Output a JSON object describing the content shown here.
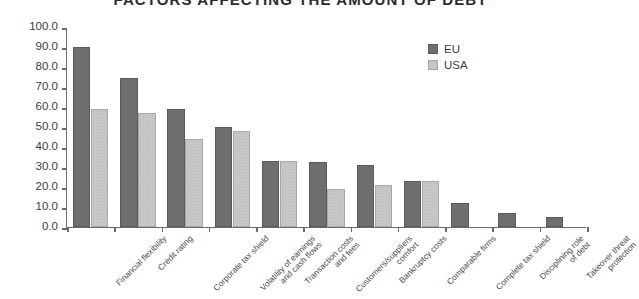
{
  "chart_data": {
    "type": "bar",
    "title": "FACTORS AFFECTING THE AMOUNT OF DEBT",
    "xlabel": "",
    "ylabel": "",
    "ylim": [
      0,
      100
    ],
    "ytick_labels": [
      "100.0",
      "90.0",
      "80.0",
      "70.0",
      "60.0",
      "50.0",
      "40.0",
      "30.0",
      "20.0",
      "10.0",
      "0.0"
    ],
    "ytick_values": [
      100,
      90,
      80,
      70,
      60,
      50,
      40,
      30,
      20,
      10,
      0
    ],
    "grid": false,
    "legend_position": "top-right",
    "categories": [
      "Financial flexibility",
      "Credit rating",
      "Corporate tax shield",
      "Volatility of earnings\nand cash flows",
      "Transaction costs\nand fees",
      "Customers/suppliers\ncomfort",
      "Bankruptcy costs",
      "Comparable firms",
      "Complete tax shield",
      "Disciplining role\nof debt",
      "Takeover threat\nprotection"
    ],
    "category_lines": [
      [
        "Financial flexibility"
      ],
      [
        "Credit rating"
      ],
      [
        "Corporate tax shield"
      ],
      [
        "Volatility of earnings",
        "and cash flows"
      ],
      [
        "Transaction costs",
        "and fees"
      ],
      [
        "Customers/suppliers",
        "comfort"
      ],
      [
        "Bankruptcy costs"
      ],
      [
        "Comparable firms"
      ],
      [
        "Complete tax shield"
      ],
      [
        "Disciplining role",
        "of debt"
      ],
      [
        "Takeover threat",
        "protection"
      ]
    ],
    "series": [
      {
        "name": "EU",
        "color": "#6e6e6e",
        "values": [
          90.0,
          74.5,
          59.0,
          50.0,
          33.0,
          32.5,
          31.0,
          23.0,
          12.0,
          7.0,
          5.0
        ]
      },
      {
        "name": "USA",
        "color": "#c7c7c7",
        "values": [
          59.0,
          57.0,
          44.0,
          48.0,
          33.0,
          19.0,
          21.0,
          23.0,
          null,
          null,
          null
        ]
      }
    ]
  },
  "legend": {
    "items": [
      {
        "label": "EU",
        "swatch": "eu"
      },
      {
        "label": "USA",
        "swatch": "usa"
      }
    ]
  }
}
